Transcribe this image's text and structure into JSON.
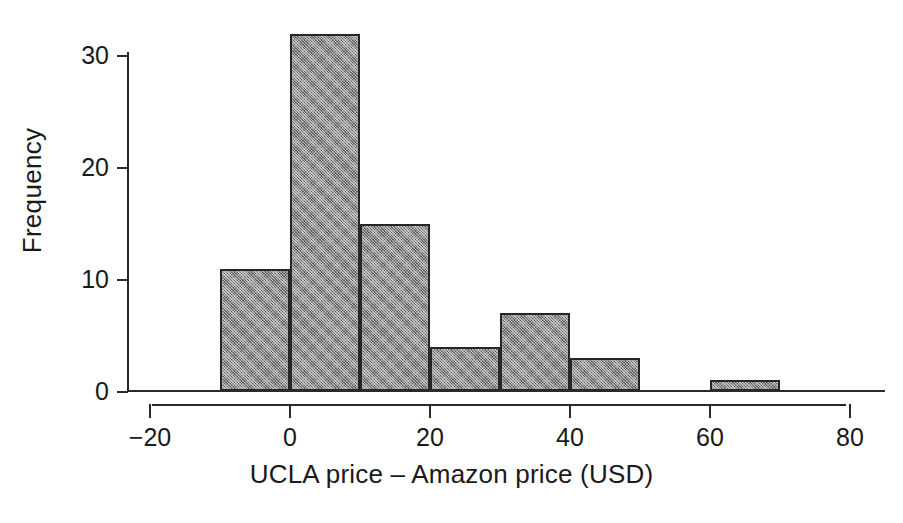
{
  "chart_data": {
    "type": "bar",
    "title": "",
    "subtitle": "",
    "xlabel": "UCLA price – Amazon price (USD)",
    "ylabel": "Frequency",
    "xlim": [
      -20,
      80
    ],
    "ylim": [
      0,
      32
    ],
    "grid": false,
    "legend": null,
    "bin_width": 10,
    "x_ticks": [
      -20,
      0,
      20,
      40,
      60,
      80
    ],
    "x_tick_labels": [
      "−20",
      "0",
      "20",
      "40",
      "60",
      "80"
    ],
    "y_ticks": [
      0,
      10,
      20,
      30
    ],
    "y_tick_labels": [
      "0",
      "10",
      "20",
      "30"
    ],
    "categories": [
      "-10 to 0",
      "0 to 10",
      "10 to 20",
      "20 to 30",
      "30 to 40",
      "40 to 50",
      "50 to 60",
      "60 to 70"
    ],
    "bins": [
      {
        "start": -10,
        "end": 0,
        "count": 11
      },
      {
        "start": 0,
        "end": 10,
        "count": 32
      },
      {
        "start": 10,
        "end": 20,
        "count": 15
      },
      {
        "start": 20,
        "end": 30,
        "count": 4
      },
      {
        "start": 30,
        "end": 40,
        "count": 7
      },
      {
        "start": 40,
        "end": 50,
        "count": 3
      },
      {
        "start": 50,
        "end": 60,
        "count": 0
      },
      {
        "start": 60,
        "end": 70,
        "count": 1
      }
    ],
    "values": [
      11,
      32,
      15,
      4,
      7,
      3,
      0,
      1
    ],
    "bar_fill_color": "#8a8a8a",
    "bar_edge_color": "#262626",
    "axis_color": "#2a2a2a",
    "background_color": "#ffffff"
  }
}
